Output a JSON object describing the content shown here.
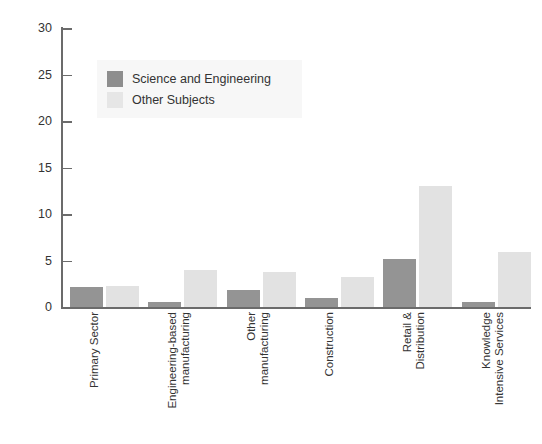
{
  "chart_data": {
    "type": "bar",
    "title": "",
    "subtitle": "",
    "xlabel": "",
    "ylabel": "",
    "ylim": [
      0,
      30
    ],
    "yticks": [
      0,
      5,
      10,
      15,
      20,
      25,
      30
    ],
    "grid": false,
    "legend_position": "upper-left-inside",
    "categories": [
      "Primary Sector",
      "Engineering-based manufacturing",
      "Other manufacturing",
      "Construction",
      "Retail & Distribution",
      "Knowledge Intensive Services"
    ],
    "category_lines": [
      [
        "Primary Sector"
      ],
      [
        "Engineering-based",
        "manufacturing"
      ],
      [
        "Other",
        "manufacturing"
      ],
      [
        "Construction"
      ],
      [
        "Retail &",
        "Distribution"
      ],
      [
        "Knowledge",
        "Intensive Services"
      ]
    ],
    "series": [
      {
        "name": "Science and Engineering",
        "color": "#949494",
        "values": [
          2.2,
          0.5,
          1.8,
          1.0,
          5.2,
          0.5
        ]
      },
      {
        "name": "Other Subjects",
        "color": "#e2e2e2",
        "values": [
          2.3,
          4.0,
          3.8,
          3.2,
          13.0,
          5.9
        ]
      }
    ]
  },
  "legend": {
    "items": [
      {
        "label": "Science and Engineering",
        "color": "#8e8e8e"
      },
      {
        "label": "Other Subjects",
        "color": "#e6e6e6"
      }
    ]
  },
  "axis": {
    "y_tick_labels": [
      "30",
      "25",
      "20",
      "15",
      "10",
      "5",
      "0"
    ]
  }
}
